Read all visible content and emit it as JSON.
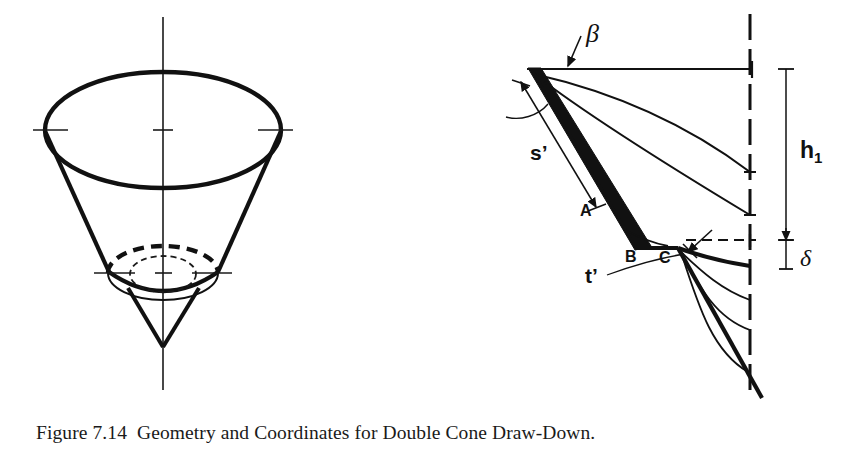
{
  "figure": {
    "caption": "Figure 7.14  Geometry and Coordinates for Double Cone Draw-Down.",
    "caption_number": "7.14",
    "title": "Geometry and Coordinates for Double Cone Draw-Down"
  },
  "colors": {
    "ink": "#111111",
    "background": "#ffffff",
    "line": "#1a1a1a"
  },
  "left_diagram": {
    "name": "double-cone-3d-view",
    "description": "Three dimensional view of a double cone hopper with outer cone, inner draw-down cone and centerlines",
    "elements": {
      "outer_top_ellipse": "solid thick ellipse",
      "outer_cone_walls": "two straight thick lines",
      "outer_bottom_arc": "solid thick arc",
      "mid_ellipse_hidden": "thick dashed upper arc",
      "mid_ellipse_visible": "thick solid lower arc",
      "inner_small_ellipse": "thin dashed ellipse",
      "inner_cone_tip": "thick V apex",
      "vertical_centerline": "thin line through axis",
      "horizontal_centerlines": "two thin lines with tick marks"
    }
  },
  "right_diagram": {
    "name": "cone-draw-down-section",
    "description": "Section through the cone showing flow-channel profiles, wall thickness and dimensions",
    "labels": {
      "beta": "β",
      "delta": "δ",
      "h1": "h",
      "h1_sub": "1",
      "s_prime": "s’",
      "t_prime": "t’",
      "point_a": "A",
      "point_b": "B",
      "point_c": "C"
    },
    "features": {
      "top_surface_line": "horizontal solid line at material top",
      "centerline": "vertical dash-dot line at cone axis",
      "cone_wall": "thick filled wedge from top-left to point B",
      "draw_down_profiles": "six curved flow profiles meeting the centerline",
      "flow_channel_boundary": "thick line from C descending to bottom right",
      "delta_dashed_line": "horizontal dashed line at level of point C"
    }
  }
}
